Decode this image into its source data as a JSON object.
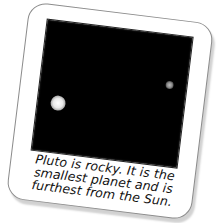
{
  "card": {
    "caption_lines": [
      "Pluto is rocky. It is the",
      "smallest planet and is",
      "furthest from the Sun."
    ]
  },
  "photo": {
    "background": "#000000",
    "objects": [
      {
        "name": "pluto",
        "color": "#ffffff",
        "size": "large"
      },
      {
        "name": "moon",
        "color": "#bdbdbd",
        "size": "small"
      }
    ]
  }
}
